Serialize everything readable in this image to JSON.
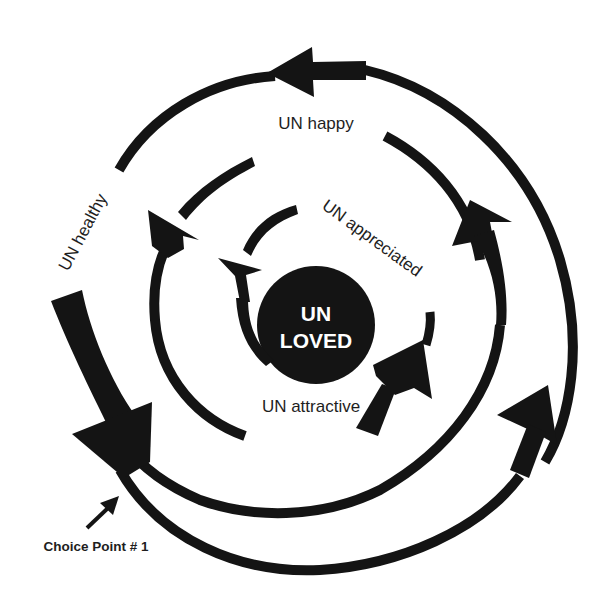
{
  "diagram": {
    "center": {
      "line1": "UN",
      "line2": "LOVED"
    },
    "labels": {
      "happy": "UN happy",
      "appreciated": "UN appreciated",
      "healthy": "UN healthy",
      "attractive": "UN attractive"
    },
    "annotation": {
      "choice_point": "Choice Point # 1"
    },
    "colors": {
      "ink": "#141414",
      "background": "#ffffff",
      "center_text": "#ffffff"
    }
  }
}
